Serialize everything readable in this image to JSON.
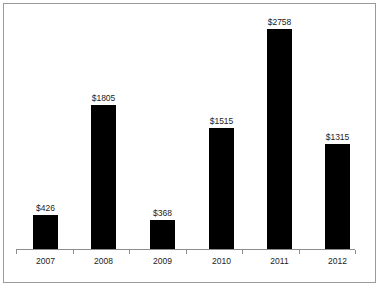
{
  "chart_data": {
    "type": "bar",
    "title": "",
    "subtitle": "",
    "xlabel": "",
    "ylabel": "",
    "categories": [
      "2007",
      "2008",
      "2009",
      "2010",
      "2011",
      "2012"
    ],
    "values": [
      426,
      1805,
      368,
      1515,
      2758,
      1315
    ],
    "value_labels": [
      "$426",
      "$1805",
      "$368",
      "$1515",
      "$2758",
      "$1315"
    ],
    "ylim": [
      0,
      2758
    ],
    "grid": false,
    "legend": null,
    "annotations": [],
    "bar_color": "#000000",
    "axis_color": "#8d8d8d",
    "label_color": "#1c1c1c",
    "border_color": "#9a9a9a",
    "background_color": "#ffffff"
  },
  "layout": {
    "baseline_y": 249,
    "axis_left": 16,
    "axis_right": 355,
    "bar_width": 25,
    "px_per_unit": 0.0798,
    "bar_left_positions": [
      33,
      91,
      150,
      209,
      267,
      325
    ]
  }
}
